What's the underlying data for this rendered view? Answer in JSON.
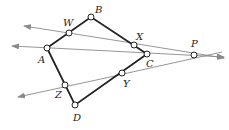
{
  "diagram": {
    "title": "",
    "colors": {
      "quad": "#222222",
      "lines": "#8a8a8a",
      "point_fill": "#ffffff"
    },
    "points": {
      "A": {
        "label": "A",
        "x": 47,
        "y": 48
      },
      "W": {
        "label": "W",
        "x": 69,
        "y": 33
      },
      "B": {
        "label": "B",
        "x": 91,
        "y": 17
      },
      "X": {
        "label": "X",
        "x": 134,
        "y": 45
      },
      "C": {
        "label": "C",
        "x": 147,
        "y": 54
      },
      "Y": {
        "label": "Y",
        "x": 122,
        "y": 73
      },
      "D": {
        "label": "D",
        "x": 75,
        "y": 105
      },
      "Z": {
        "label": "Z",
        "x": 65,
        "y": 85
      },
      "P": {
        "label": "P",
        "x": 194,
        "y": 55
      }
    },
    "quadrilateral": [
      "A",
      "B",
      "C",
      "D"
    ],
    "lines": [
      {
        "name": "line-WXP",
        "through": [
          "W",
          "X",
          "P"
        ]
      },
      {
        "name": "line-ACP",
        "through": [
          "A",
          "C",
          "P"
        ]
      },
      {
        "name": "line-ZYP",
        "through": [
          "Z",
          "Y",
          "P"
        ]
      }
    ]
  }
}
